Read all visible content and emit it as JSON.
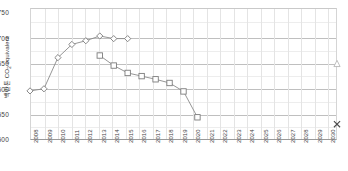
{
  "chart_data": {
    "type": "line",
    "title": "",
    "xlabel": "",
    "ylabel": "백만톤 CO2 equivalent",
    "ylabel_main": "백만톤 CO",
    "ylabel_sub": "2",
    "ylabel_tail": " equivalent",
    "x": [
      2008,
      2009,
      2010,
      2011,
      2012,
      2013,
      2014,
      2015,
      2016,
      2017,
      2018,
      2019,
      2020,
      2021,
      2022,
      2023,
      2024,
      2025,
      2026,
      2027,
      2028,
      2029,
      2030
    ],
    "xlim": [
      2008,
      2030
    ],
    "ylim": [
      500,
      750
    ],
    "yticks": [
      500,
      550,
      600,
      650,
      700,
      750
    ],
    "ytick_labels": [
      "500",
      "550",
      "600",
      "650",
      "700",
      "750"
    ],
    "xtick_labels": [
      "2008",
      "2009",
      "2010",
      "2011",
      "2012",
      "2013",
      "2014",
      "2015",
      "2016",
      "2017",
      "2018",
      "2019",
      "2020",
      "2021",
      "2022",
      "2023",
      "2024",
      "2025",
      "2026",
      "2027",
      "2028",
      "2029",
      "2030"
    ],
    "grid": true,
    "legend": "none",
    "series": [
      {
        "name": "diamond-series",
        "marker": "diamond",
        "color": "#7c7c7c",
        "x": [
          2008,
          2009,
          2010,
          2011,
          2012,
          2013,
          2014,
          2015
        ],
        "values": [
          593,
          597,
          656,
          681,
          688,
          697,
          692,
          692
        ]
      },
      {
        "name": "square-series",
        "marker": "square",
        "color": "#7c7c7c",
        "x": [
          2013,
          2014,
          2015,
          2016,
          2017,
          2018,
          2019,
          2020
        ],
        "values": [
          660,
          641,
          627,
          621,
          615,
          608,
          592,
          543
        ]
      },
      {
        "name": "triangle-target-point",
        "marker": "triangle",
        "color": "#b9b9b9",
        "x": [
          2030
        ],
        "values": [
          645
        ]
      },
      {
        "name": "x-target-point",
        "marker": "x",
        "color": "#4a4a4a",
        "x": [
          2030
        ],
        "values": [
          530
        ]
      }
    ]
  }
}
